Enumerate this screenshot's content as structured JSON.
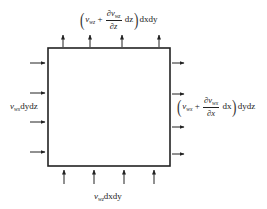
{
  "diagram": {
    "type": "control-volume-flux",
    "box": {
      "x": 48,
      "y": 48,
      "width": 122,
      "height": 118,
      "stroke": "#222222"
    },
    "arrows": {
      "top": {
        "direction": "up",
        "positions_x": [
          63,
          90,
          122,
          159
        ],
        "y_from": 47,
        "y_to": 35
      },
      "bottom": {
        "direction": "up",
        "positions_x": [
          64,
          94,
          124,
          154
        ],
        "y_from": 184,
        "y_to": 170
      },
      "left": {
        "direction": "right",
        "positions_y": [
          63,
          93,
          122,
          152
        ],
        "x_from": 30,
        "x_to": 45
      },
      "right": {
        "direction": "right",
        "positions_y": [
          63,
          94,
          127,
          154
        ],
        "x_from": 172,
        "x_to": 184
      }
    },
    "labels": {
      "top": {
        "var": "v",
        "var_sub": "wz",
        "plus": "+",
        "deriv_num": "∂v",
        "deriv_num_sub": "wz",
        "deriv_den": "∂z",
        "diff": "dz",
        "area": "dxdy"
      },
      "right": {
        "var": "v",
        "var_sub": "wx",
        "plus": "+",
        "deriv_num": "∂v",
        "deriv_num_sub": "wx",
        "deriv_den": "∂x",
        "diff": "dx",
        "area": "dydz"
      },
      "left": {
        "var": "v",
        "var_sub": "wx",
        "area": "dydz"
      },
      "bottom": {
        "var": "v",
        "var_sub": "wz",
        "area": "dxdy"
      }
    },
    "paren_open": "(",
    "paren_close": ")"
  }
}
